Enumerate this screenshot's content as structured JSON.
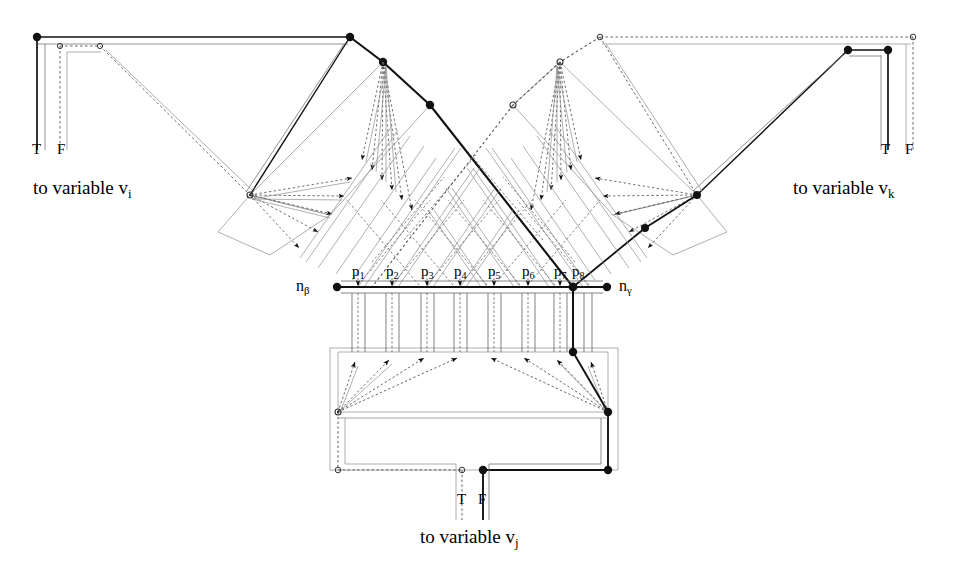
{
  "figure": {
    "background_color": "#ffffff",
    "line_color": "#1a1a1a",
    "thin_line_color": "#8a8a8a"
  },
  "variables": {
    "left": {
      "caption": "to variable v",
      "subscript": "i",
      "true_label": "T",
      "false_label": "F"
    },
    "right": {
      "caption": "to variable v",
      "subscript": "k",
      "true_label": "T",
      "false_label": "F"
    },
    "bottom": {
      "caption": "to variable v",
      "subscript": "j",
      "true_label": "T",
      "false_label": "F"
    }
  },
  "spine": {
    "left_terminal": {
      "label": "n",
      "subscript": "β"
    },
    "right_terminal": {
      "label": "n",
      "subscript": "γ"
    },
    "nodes": [
      {
        "label": "p",
        "subscript": "1"
      },
      {
        "label": "p",
        "subscript": "2"
      },
      {
        "label": "p",
        "subscript": "3"
      },
      {
        "label": "p",
        "subscript": "4"
      },
      {
        "label": "p",
        "subscript": "5"
      },
      {
        "label": "p",
        "subscript": "6"
      },
      {
        "label": "p",
        "subscript": "7"
      },
      {
        "label": "p",
        "subscript": "8"
      }
    ]
  }
}
